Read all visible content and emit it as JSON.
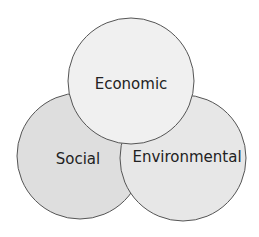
{
  "diagram": {
    "type": "venn",
    "circles": [
      {
        "id": "social",
        "label": "Social",
        "cx": 80,
        "cy": 156,
        "r": 63,
        "fill": "#dedede"
      },
      {
        "id": "environmental",
        "label": "Environmental",
        "cx": 183,
        "cy": 158,
        "r": 63,
        "fill": "#e7e7e7"
      },
      {
        "id": "economic",
        "label": "Economic",
        "cx": 131,
        "cy": 81,
        "r": 63,
        "fill": "#f0f0f0"
      }
    ],
    "stroke": "#555555"
  }
}
